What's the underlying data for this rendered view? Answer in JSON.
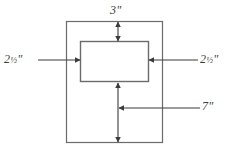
{
  "figure": {
    "stroke_color": "#6b6b6b",
    "arrow_color": "#3b3b3b",
    "text_color": "#3b3b3b",
    "background_color": "#ffffff"
  },
  "shapes": {
    "outer_rectangle": {
      "name": "outer-border-rectangle",
      "x": 66,
      "y": 21,
      "width": 97,
      "height": 122
    },
    "inner_rectangle": {
      "name": "inner-opening-rectangle",
      "x": 80,
      "y": 41,
      "width": 69,
      "height": 41
    }
  },
  "dimensions": {
    "top": {
      "label": "3\"",
      "value": "3",
      "unit": "\"",
      "fraction": "",
      "measures": "top-margin"
    },
    "left": {
      "label": "2½\"",
      "value": "2",
      "fraction": "½",
      "unit": "\"",
      "measures": "left-margin"
    },
    "right": {
      "label": "2½\"",
      "value": "2",
      "fraction": "½",
      "unit": "\"",
      "measures": "right-margin"
    },
    "bottom": {
      "label": "7\"",
      "value": "7",
      "fraction": "",
      "unit": "\"",
      "measures": "bottom-margin"
    }
  }
}
